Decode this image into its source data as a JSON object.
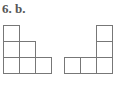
{
  "label": "6. b.",
  "figures": [
    {
      "name": "left-staircase",
      "cells": [
        [
          0,
          0
        ],
        [
          0,
          1
        ],
        [
          1,
          1
        ],
        [
          0,
          2
        ],
        [
          1,
          2
        ],
        [
          2,
          2
        ]
      ]
    },
    {
      "name": "right-l-shape",
      "cells": [
        [
          2,
          0
        ],
        [
          2,
          1
        ],
        [
          0,
          2
        ],
        [
          1,
          2
        ],
        [
          2,
          2
        ]
      ]
    }
  ]
}
